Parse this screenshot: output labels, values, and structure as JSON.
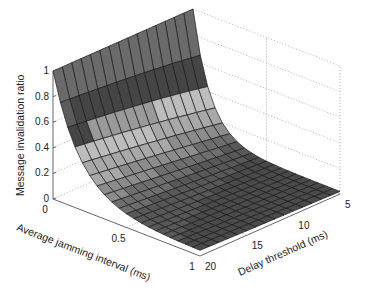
{
  "chart_data": {
    "type": "surface3d",
    "title": "",
    "xlabel": "Average jamming interval (ms)",
    "ylabel": "Delay threshold (ms)",
    "zlabel": "Message invalidation ratio",
    "x_ticks": [
      "0",
      "0.5",
      "1"
    ],
    "y_ticks": [
      "5",
      "10",
      "15",
      "20"
    ],
    "z_ticks": [
      "0",
      "0.2",
      "0.4",
      "0.6",
      "0.8",
      "1"
    ],
    "xlim": [
      0,
      1
    ],
    "ylim": [
      5,
      20
    ],
    "zlim": [
      0,
      1
    ],
    "grid": true,
    "colormap": "gray",
    "x_samples": 21,
    "y_samples": 16,
    "sample_values": [
      {
        "x": 0.0,
        "y": 5,
        "z": 1.0
      },
      {
        "x": 0.0,
        "y": 20,
        "z": 1.0
      },
      {
        "x": 0.1,
        "y": 20,
        "z": 0.65
      },
      {
        "x": 0.2,
        "y": 20,
        "z": 0.4
      },
      {
        "x": 0.5,
        "y": 20,
        "z": 0.12
      },
      {
        "x": 1.0,
        "y": 20,
        "z": 0.03
      },
      {
        "x": 0.1,
        "y": 5,
        "z": 0.55
      },
      {
        "x": 0.5,
        "y": 5,
        "z": 0.08
      },
      {
        "x": 1.0,
        "y": 5,
        "z": 0.02
      }
    ]
  },
  "projection": {
    "origin": [
      53,
      199
    ],
    "x_vec": [
      147,
      57
    ],
    "y_vec": [
      140,
      -62
    ],
    "z_vec": [
      0,
      -128
    ]
  }
}
